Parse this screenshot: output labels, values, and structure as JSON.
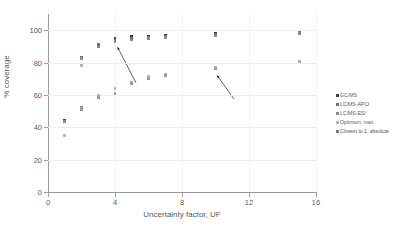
{
  "chart_data": {
    "type": "scatter",
    "title": "",
    "xlabel": "Uncertainty factor, UF",
    "ylabel": "% coverage",
    "xlim": [
      0,
      16
    ],
    "ylim": [
      0,
      110
    ],
    "xticks": [
      0,
      4,
      8,
      12,
      16
    ],
    "yticks": [
      0,
      20,
      40,
      60,
      80,
      100
    ],
    "grid": "horizontal and vertical gridlines at ticks",
    "legend_position": "right outside",
    "series": [
      {
        "name": "GC/MS",
        "color": "#3f3f43",
        "points": [
          {
            "x": 1,
            "y": 44.5
          },
          {
            "x": 2,
            "y": 83.5
          },
          {
            "x": 3,
            "y": 91.5
          },
          {
            "x": 4,
            "y": 95.0
          },
          {
            "x": 5,
            "y": 96.0
          },
          {
            "x": 6,
            "y": 96.5
          },
          {
            "x": 7,
            "y": 97.0
          },
          {
            "x": 10,
            "y": 98.0
          },
          {
            "x": 15,
            "y": 99.0
          }
        ]
      },
      {
        "name": "LC/MS-APCI",
        "color": "#6e6e73",
        "points": [
          {
            "x": 1,
            "y": 44.0
          },
          {
            "x": 2,
            "y": 83.0
          },
          {
            "x": 3,
            "y": 91.0
          },
          {
            "x": 4,
            "y": 94.0
          },
          {
            "x": 5,
            "y": 95.0
          },
          {
            "x": 6,
            "y": 95.5
          },
          {
            "x": 7,
            "y": 96.0
          },
          {
            "x": 10,
            "y": 97.5
          },
          {
            "x": 15,
            "y": 98.5
          }
        ]
      },
      {
        "name": "LC/MS-ESI",
        "color": "#8a8a8f",
        "points": [
          {
            "x": 1,
            "y": 43.5
          },
          {
            "x": 2,
            "y": 82.5
          },
          {
            "x": 3,
            "y": 89.5
          },
          {
            "x": 4,
            "y": 93.0
          },
          {
            "x": 5,
            "y": 94.0
          },
          {
            "x": 6,
            "y": 95.0
          },
          {
            "x": 7,
            "y": 95.5
          },
          {
            "x": 10,
            "y": 96.5
          },
          {
            "x": 15,
            "y": 98.0
          }
        ]
      },
      {
        "name": "Optimum, max",
        "color": "#b4b4b8",
        "points": [
          {
            "x": 1,
            "y": 35.0
          },
          {
            "x": 2,
            "y": 78.0
          },
          {
            "x": 3,
            "y": 60.0
          },
          {
            "x": 4,
            "y": 64.0
          },
          {
            "x": 5,
            "y": 67.5
          },
          {
            "x": 6,
            "y": 71.5
          },
          {
            "x": 7,
            "y": 72.5
          },
          {
            "x": 10,
            "y": 77.0
          },
          {
            "x": 15,
            "y": 80.5
          }
        ]
      },
      {
        "name": "Closest to 1, absolute",
        "color": "#9a9a9f",
        "points": [
          {
            "x": 2,
            "y": 52.5
          },
          {
            "x": 2,
            "y": 51.0
          },
          {
            "x": 3,
            "y": 58.5
          },
          {
            "x": 4,
            "y": 61.0
          },
          {
            "x": 5,
            "y": 67.0
          },
          {
            "x": 6,
            "y": 70.0
          },
          {
            "x": 7,
            "y": 72.0
          },
          {
            "x": 10,
            "y": 76.0
          }
        ]
      }
    ],
    "annotations": [
      {
        "name": "arrow-upper",
        "from_x": 5.25,
        "from_y": 67.5,
        "to_x": 4.15,
        "to_y": 89.5
      },
      {
        "name": "arrow-lower",
        "from_x": 11.1,
        "from_y": 57.5,
        "to_x": 10.1,
        "to_y": 72.0
      }
    ]
  },
  "legend": {
    "items": [
      {
        "label": "GC/MS",
        "color": "#3f3f43"
      },
      {
        "label": "LC/MS-APCI",
        "color": "#6e6e73"
      },
      {
        "label": "LC/MS-ESI",
        "color": "#8a8a8f"
      },
      {
        "label": "Optimum, max",
        "color": "#b4b4b8"
      },
      {
        "label": "Closest to 1, absolute",
        "color": "#7a7a7f"
      }
    ]
  }
}
